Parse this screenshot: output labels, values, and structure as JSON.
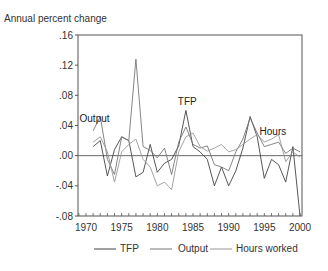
{
  "chart_data": {
    "type": "line",
    "title": "",
    "ylabel": "Annual percent change",
    "xlabel": "",
    "ylim": [
      -0.08,
      0.16
    ],
    "xlim": [
      1969,
      2000
    ],
    "yticks": [
      ".16",
      ".12",
      ".08",
      ".04",
      ".00",
      "-.04",
      "-.08"
    ],
    "ytick_values": [
      0.16,
      0.12,
      0.08,
      0.04,
      0.0,
      -0.04,
      -0.08
    ],
    "xticks": [
      "1970",
      "1975",
      "1980",
      "1985",
      "1990",
      "1995",
      "2000"
    ],
    "xtick_values": [
      1970,
      1975,
      1980,
      1985,
      1990,
      1995,
      2000
    ],
    "grid": false,
    "legend_position": "bottom",
    "annotations": [
      {
        "text": "Output",
        "x": 1971.2,
        "y": 0.045
      },
      {
        "text": "TFP",
        "x": 1984.2,
        "y": 0.067
      },
      {
        "text": "Hours",
        "x": 1996.2,
        "y": 0.028
      }
    ],
    "x": [
      1971,
      1972,
      1973,
      1974,
      1975,
      1976,
      1977,
      1978,
      1979,
      1980,
      1981,
      1982,
      1983,
      1984,
      1985,
      1986,
      1987,
      1988,
      1989,
      1990,
      1991,
      1992,
      1993,
      1994,
      1995,
      1996,
      1997,
      1998,
      1999,
      2000
    ],
    "series": [
      {
        "name": "TFP",
        "style": "solid",
        "values": [
          0.012,
          0.02,
          -0.027,
          0.008,
          0.025,
          0.02,
          -0.028,
          -0.022,
          0.015,
          -0.022,
          -0.01,
          -0.005,
          0.013,
          0.06,
          0.012,
          0.005,
          -0.005,
          -0.04,
          -0.015,
          -0.04,
          -0.02,
          0.01,
          0.052,
          0.025,
          -0.03,
          -0.005,
          -0.012,
          -0.035,
          0.012,
          -0.08
        ]
      },
      {
        "name": "Output",
        "style": "dashed",
        "values": [
          0.033,
          0.052,
          -0.005,
          -0.025,
          0.025,
          0.02,
          0.128,
          0.012,
          0.007,
          -0.003,
          0.01,
          -0.025,
          0.018,
          0.038,
          0.015,
          0.01,
          0.013,
          -0.012,
          -0.015,
          -0.02,
          0.005,
          0.022,
          0.05,
          0.03,
          0.012,
          0.015,
          0.018,
          0.003,
          0.01,
          0.005
        ]
      },
      {
        "name": "Hours worked",
        "style": "dotted",
        "values": [
          0.018,
          0.025,
          0.005,
          -0.035,
          0.005,
          0.015,
          0.022,
          -0.005,
          -0.015,
          -0.04,
          -0.035,
          -0.045,
          0.005,
          0.025,
          0.03,
          0.012,
          0.006,
          0.01,
          0.015,
          0.005,
          0.008,
          0.015,
          0.022,
          0.028,
          0.018,
          0.022,
          0.028,
          -0.008,
          0.005,
          -0.002
        ]
      }
    ]
  },
  "legend": {
    "items": [
      {
        "label": "TFP"
      },
      {
        "label": "Output"
      },
      {
        "label": "Hours worked"
      }
    ]
  }
}
